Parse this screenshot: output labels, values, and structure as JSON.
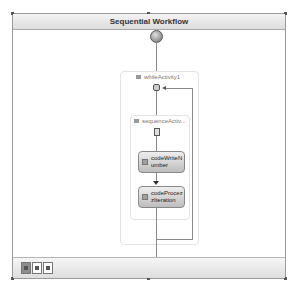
{
  "workflow": {
    "title": "Sequential Workflow",
    "start_node_icon": "start-icon",
    "end_node_icon": "end-icon",
    "while_activity": {
      "label": "whileActivity1",
      "icon": "while-loop-icon"
    },
    "sequence_activity": {
      "label": "sequenceActiv...",
      "icon": "sequence-icon"
    },
    "code_activities": [
      {
        "label": "codeWriteNumber",
        "display": "codeWriteN umber",
        "icon": "code-activity-icon"
      },
      {
        "label": "codeProcessIteration",
        "display": "codeProcez zIteration",
        "icon": "code-activity-icon"
      }
    ]
  },
  "bottom_bar": {
    "view_tabs": [
      {
        "name": "workflow-view",
        "active": true,
        "icon": "workflow-view-icon"
      },
      {
        "name": "cancel-handlers-view",
        "active": false,
        "icon": "cancel-handler-icon"
      },
      {
        "name": "fault-handlers-view",
        "active": false,
        "icon": "fault-handler-icon"
      }
    ]
  },
  "colors": {
    "frame_border": "#9a9a9a",
    "title_bg": "#dcdcdc",
    "activity_fill": "#c8c8c8",
    "connector": "#8a8a8a"
  }
}
